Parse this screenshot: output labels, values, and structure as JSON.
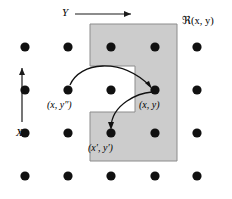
{
  "figure": {
    "title": "",
    "background_color": "#ffffff",
    "ink_color": "#000000",
    "region_fill_color": "#cccccc",
    "region_stroke_color": "#888888",
    "width": 232,
    "height": 199
  },
  "axes": {
    "horizontal": {
      "label": "Y",
      "direction": "right",
      "arrow_icon": "arrow-right-icon"
    },
    "vertical": {
      "label": "X",
      "direction": "up",
      "arrow_icon": "arrow-up-icon"
    }
  },
  "region": {
    "label": "ℜ(x, y)",
    "shape": "notched-rectangle",
    "notch": "left-middle"
  },
  "points": [
    {
      "id": "x-ypp",
      "label": "(x, y″)",
      "row": 2,
      "col": 2
    },
    {
      "id": "x-y",
      "label": "(x, y)",
      "row": 2,
      "col": 4
    },
    {
      "id": "xp-yp",
      "label": "(x′, y′)",
      "row": 3,
      "col": 3
    }
  ],
  "arrows": [
    {
      "id": "arrow-ypp-to-y",
      "from": "x-ypp",
      "to": "x-y",
      "style": "arc-over"
    },
    {
      "id": "arrow-y-to-xpyp",
      "from": "x-y",
      "to": "xp-yp",
      "style": "arc-down-left"
    }
  ],
  "grid": {
    "rows": 4,
    "cols": 5,
    "dot_radius": 4.6,
    "col_x": [
      25,
      68,
      111,
      155,
      197
    ],
    "row_y": [
      47,
      90,
      133,
      176
    ]
  }
}
